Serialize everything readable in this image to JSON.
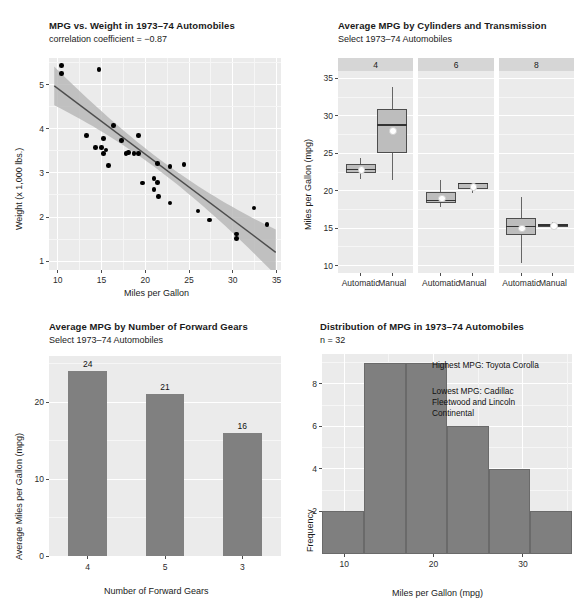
{
  "page": {
    "width": 585,
    "height": 605,
    "background": "#ffffff",
    "panel_fill": "#ebebeb",
    "bar_color": "#808080",
    "box_fill": "#bdbdbd",
    "point_color": "#000000"
  },
  "panels": {
    "scatter": {
      "title": "MPG vs. Weight in 1973–74 Automobiles",
      "subtitle": "correlation coefficient = −0.87"
    },
    "box": {
      "title": "Average MPG by Cylinders and Transmission",
      "subtitle": "Select 1973–74 Automobiles"
    },
    "bar": {
      "title": "Average MPG by Number of Forward Gears",
      "subtitle": "Select 1973–74 Automobiles"
    },
    "hist": {
      "title": "Distribution of MPG in 1973–74 Automobiles",
      "subtitle": "n = 32",
      "annotation_high": "Highest MPG: Toyota Corolla",
      "annotation_low": "Lowest MPG: Cadillac\nFleetwood and Lincoln\nContinental"
    }
  },
  "chart_data": [
    {
      "id": "scatter",
      "type": "scatter",
      "title": "MPG vs. Weight in 1973–74 Automobiles",
      "subtitle": "correlation coefficient = −0.87",
      "xlabel": "Miles per Gallon",
      "ylabel": "Weight (x 1,000 lbs.)",
      "xlim": [
        9.0,
        35.5
      ],
      "ylim": [
        0.8,
        5.6
      ],
      "xticks": [
        10,
        15,
        20,
        25,
        30,
        35
      ],
      "yticks": [
        1,
        2,
        3,
        4,
        5
      ],
      "grid": true,
      "legend": "none",
      "correlation": -0.87,
      "points": [
        {
          "x": 21.0,
          "y": 2.62
        },
        {
          "x": 21.0,
          "y": 2.875
        },
        {
          "x": 22.8,
          "y": 2.32
        },
        {
          "x": 21.4,
          "y": 3.215
        },
        {
          "x": 18.7,
          "y": 3.44
        },
        {
          "x": 18.1,
          "y": 3.46
        },
        {
          "x": 14.3,
          "y": 3.57
        },
        {
          "x": 24.4,
          "y": 3.19
        },
        {
          "x": 22.8,
          "y": 3.15
        },
        {
          "x": 19.2,
          "y": 3.44
        },
        {
          "x": 17.8,
          "y": 3.44
        },
        {
          "x": 16.4,
          "y": 4.07
        },
        {
          "x": 17.3,
          "y": 3.73
        },
        {
          "x": 15.2,
          "y": 3.78
        },
        {
          "x": 10.4,
          "y": 5.25
        },
        {
          "x": 10.4,
          "y": 5.424
        },
        {
          "x": 14.7,
          "y": 5.345
        },
        {
          "x": 32.4,
          "y": 2.2
        },
        {
          "x": 30.4,
          "y": 1.615
        },
        {
          "x": 33.9,
          "y": 1.835
        },
        {
          "x": 21.5,
          "y": 2.465
        },
        {
          "x": 15.5,
          "y": 3.52
        },
        {
          "x": 15.2,
          "y": 3.435
        },
        {
          "x": 13.3,
          "y": 3.84
        },
        {
          "x": 19.2,
          "y": 3.845
        },
        {
          "x": 27.3,
          "y": 1.935
        },
        {
          "x": 26.0,
          "y": 2.14
        },
        {
          "x": 30.4,
          "y": 1.513
        },
        {
          "x": 15.8,
          "y": 3.17
        },
        {
          "x": 19.7,
          "y": 2.77
        },
        {
          "x": 15.0,
          "y": 3.57
        },
        {
          "x": 21.4,
          "y": 2.78
        }
      ],
      "fit": {
        "intercept": 6.4,
        "slope": -0.149,
        "band": "95% confidence"
      }
    },
    {
      "id": "box",
      "type": "boxplot",
      "title": "Average MPG by Cylinders and Transmission",
      "subtitle": "Select 1973–74 Automobiles",
      "ylabel": "Miles per Gallon (mpg)",
      "xlabel": "",
      "ylim": [
        9.0,
        36.0
      ],
      "yticks": [
        10,
        15,
        20,
        25,
        30,
        35
      ],
      "facets": [
        "4",
        "6",
        "8"
      ],
      "facet_variable": "Cylinders",
      "categories": [
        "Automatic",
        "Manual"
      ],
      "grid": true,
      "boxes": [
        {
          "facet": "4",
          "group": "Automatic",
          "min": 21.5,
          "q1": 22.4,
          "median": 22.8,
          "q3": 23.6,
          "max": 24.4,
          "mean": 22.9
        },
        {
          "facet": "4",
          "group": "Manual",
          "min": 21.4,
          "q1": 25.1,
          "median": 28.8,
          "q3": 30.9,
          "max": 33.9,
          "mean": 28.1
        },
        {
          "facet": "6",
          "group": "Automatic",
          "min": 17.8,
          "q1": 18.3,
          "median": 18.7,
          "q3": 19.8,
          "max": 21.4,
          "mean": 19.1
        },
        {
          "facet": "6",
          "group": "Manual",
          "min": 19.7,
          "q1": 20.2,
          "median": 21.0,
          "q3": 21.0,
          "max": 21.0,
          "mean": 20.6
        },
        {
          "facet": "8",
          "group": "Automatic",
          "min": 10.4,
          "q1": 14.1,
          "median": 15.2,
          "q3": 16.3,
          "max": 19.2,
          "mean": 15.1
        },
        {
          "facet": "8",
          "group": "Manual",
          "min": 15.0,
          "q1": 15.2,
          "median": 15.4,
          "q3": 15.6,
          "max": 15.8,
          "mean": 15.4
        }
      ]
    },
    {
      "id": "bar",
      "type": "bar",
      "title": "Average MPG by Number of Forward Gears",
      "subtitle": "Select 1973–74 Automobiles",
      "xlabel": "Number of Forward Gears",
      "ylabel": "Average Miles per Gallon (mpg)",
      "categories": [
        "4",
        "5",
        "3"
      ],
      "values": [
        24,
        21,
        16
      ],
      "labels": [
        "24",
        "21",
        "16"
      ],
      "ylim": [
        0,
        26
      ],
      "yticks": [
        0,
        10,
        20
      ],
      "grid": true
    },
    {
      "id": "hist",
      "type": "bar",
      "histogram": true,
      "title": "Distribution of MPG in 1973–74 Automobiles",
      "subtitle": "n = 32",
      "xlabel": "Miles per Gallon (mpg)",
      "ylabel": "Frequency",
      "n": 32,
      "xlim": [
        7.5,
        35.5
      ],
      "ylim": [
        0,
        9.4
      ],
      "xticks": [
        10,
        20,
        30
      ],
      "yticks": [
        2,
        4,
        6,
        8
      ],
      "bin_edges": [
        7.5,
        12.2,
        16.9,
        21.5,
        26.2,
        30.8,
        35.5
      ],
      "values": [
        2,
        9,
        9,
        6,
        4,
        2
      ],
      "grid": true,
      "annotations": [
        "Highest MPG: Toyota Corolla",
        "Lowest MPG: Cadillac\nFleetwood and Lincoln\nContinental"
      ]
    }
  ]
}
